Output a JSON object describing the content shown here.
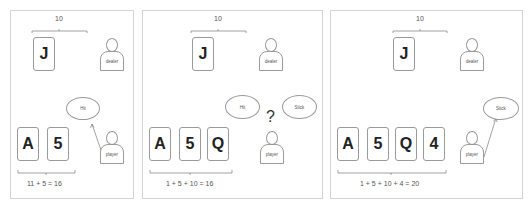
{
  "panels": [
    {
      "dealer_total": "10",
      "dealer_cards": [
        "J"
      ],
      "dealer_label": "dealer",
      "player_label": "player",
      "player_cards": [
        "A",
        "5"
      ],
      "bubbles": [
        "Hit"
      ],
      "equation": "11 + 5 = 16"
    },
    {
      "dealer_total": "10",
      "dealer_cards": [
        "J"
      ],
      "dealer_label": "dealer",
      "player_label": "player",
      "player_cards": [
        "A",
        "5",
        "Q"
      ],
      "bubbles": [
        "Hit",
        "Stick"
      ],
      "question": "?",
      "equation": "1 + 5 + 10 = 16"
    },
    {
      "dealer_total": "10",
      "dealer_cards": [
        "J"
      ],
      "dealer_label": "dealer",
      "player_label": "player",
      "player_cards": [
        "A",
        "5",
        "Q",
        "4"
      ],
      "bubbles": [
        "Stick"
      ],
      "equation": "1 + 5 + 10 + 4 = 20"
    }
  ]
}
